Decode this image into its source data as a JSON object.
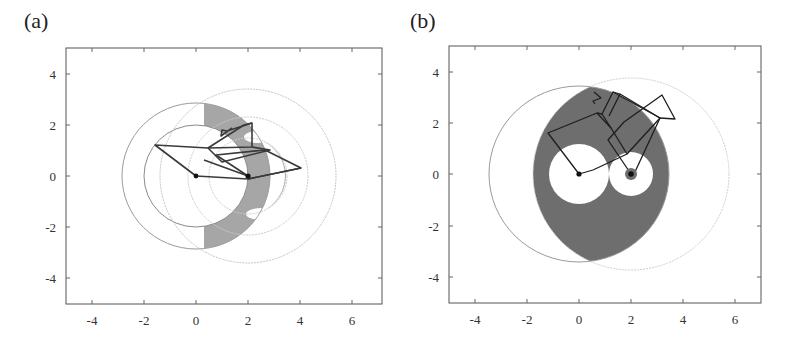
{
  "panels": [
    {
      "label": "(a)",
      "frame_px": {
        "left": 66,
        "top": 48,
        "right": 382,
        "bottom": 304
      },
      "xlim": [
        -5,
        7
      ],
      "ylim": [
        -5,
        5
      ],
      "xticks": [
        "-4",
        "-2",
        "0",
        "2",
        "4",
        "6"
      ],
      "yticks": [
        "4",
        "2",
        "0",
        "-2",
        "-4"
      ],
      "base_points": [
        [
          0,
          0
        ],
        [
          2,
          0
        ]
      ],
      "circles": [
        {
          "cx": 0,
          "cy": 0,
          "r": 2.85,
          "style": "solid"
        },
        {
          "cx": 0,
          "cy": 0,
          "r": 2.0,
          "style": "solid"
        },
        {
          "cx": 2,
          "cy": 0,
          "r": 3.4,
          "style": "dotted"
        },
        {
          "cx": 2,
          "cy": 0,
          "r": 1.5,
          "style": "dotted"
        },
        {
          "cx": 2,
          "cy": 0,
          "r": 2.3,
          "style": "dotted"
        }
      ],
      "shaded_color": "#a6a6a6",
      "linkage_color": "#3a3a3a"
    },
    {
      "label": "(b)",
      "frame_px": {
        "left": 449,
        "top": 46,
        "right": 761,
        "bottom": 303
      },
      "xlim": [
        -5,
        7
      ],
      "ylim": [
        -5,
        5
      ],
      "xticks": [
        "-4",
        "-2",
        "0",
        "2",
        "4",
        "6"
      ],
      "yticks": [
        "4",
        "2",
        "0",
        "-2",
        "-4"
      ],
      "base_points": [
        [
          0,
          0
        ],
        [
          2,
          0
        ]
      ],
      "circles": [
        {
          "cx": 0,
          "cy": 0,
          "r": 3.45,
          "style": "solid"
        },
        {
          "cx": 2,
          "cy": 0,
          "r": 3.75,
          "style": "dotted"
        }
      ],
      "holes": [
        {
          "cx": 0,
          "cy": 0,
          "r": 1.15
        },
        {
          "cx": 2,
          "cy": 0,
          "r": 0.85
        }
      ],
      "shaded_color": "#6e6e6e",
      "linkage_color": "#1e1e1e"
    }
  ]
}
